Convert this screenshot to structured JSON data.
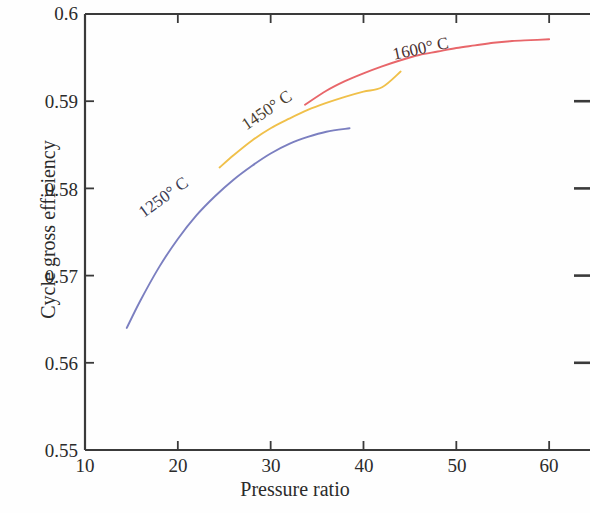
{
  "chart_data": {
    "type": "line",
    "title": "",
    "xlabel": "Pressure ratio",
    "ylabel": "Cycle gross efficiency",
    "xlim": [
      10,
      63
    ],
    "ylim": [
      0.55,
      0.6
    ],
    "xticks": [
      10,
      20,
      30,
      40,
      50,
      60
    ],
    "xtick_labels": [
      "10",
      "20",
      "30",
      "40",
      "50",
      "60"
    ],
    "yticks": [
      0.55,
      0.56,
      0.57,
      0.58,
      0.59,
      0.6
    ],
    "ytick_labels": [
      "0.55",
      "0.56",
      "0.57",
      "0.58",
      "0.59",
      "0.6"
    ],
    "grid": false,
    "legend_position": "inline-curve-labels",
    "series": [
      {
        "name": "1250° C",
        "label": "1250° C",
        "color": "#7b7fc0",
        "x": [
          14.5,
          16.0,
          18.0,
          20.0,
          22.0,
          24.0,
          26.0,
          28.0,
          30.0,
          32.0,
          34.0,
          36.0,
          38.5
        ],
        "y": [
          0.564,
          0.5672,
          0.571,
          0.5742,
          0.5769,
          0.5791,
          0.581,
          0.5826,
          0.584,
          0.5851,
          0.5859,
          0.5865,
          0.5869
        ]
      },
      {
        "name": "1450° C",
        "label": "1450° C",
        "color": "#f0c04a",
        "x": [
          24.5,
          26.0,
          28.0,
          30.0,
          32.0,
          34.0,
          36.0,
          38.0,
          40.0,
          42.0,
          44.0
        ],
        "y": [
          0.5824,
          0.5838,
          0.5855,
          0.5869,
          0.588,
          0.589,
          0.5898,
          0.5905,
          0.5911,
          0.5916,
          0.5934
        ]
      },
      {
        "name": "1600° C",
        "label": "1600° C",
        "color": "#e8666a",
        "x": [
          33.7,
          36.0,
          38.0,
          40.0,
          42.0,
          44.0,
          46.0,
          48.0,
          50.0,
          52.0,
          54.0,
          56.0,
          58.0,
          60.0
        ],
        "y": [
          0.5896,
          0.5912,
          0.5923,
          0.5932,
          0.594,
          0.5947,
          0.5953,
          0.5957,
          0.5961,
          0.5964,
          0.5967,
          0.5969,
          0.597,
          0.5971
        ]
      }
    ]
  },
  "axes": {
    "frame_color": "#3a3a3a"
  }
}
